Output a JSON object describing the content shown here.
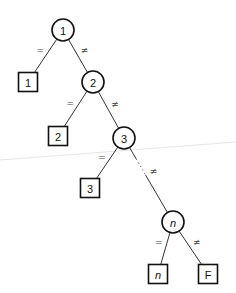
{
  "diagram": {
    "type": "decision-tree",
    "nodes": [
      {
        "id": "c1",
        "kind": "circle",
        "label": "1",
        "italic": false
      },
      {
        "id": "s1",
        "kind": "square",
        "label": "1",
        "italic": false
      },
      {
        "id": "c2",
        "kind": "circle",
        "label": "2",
        "italic": false
      },
      {
        "id": "s2",
        "kind": "square",
        "label": "2",
        "italic": false
      },
      {
        "id": "c3",
        "kind": "circle",
        "label": "3",
        "italic": false
      },
      {
        "id": "s3",
        "kind": "square",
        "label": "3",
        "italic": false
      },
      {
        "id": "cn",
        "kind": "circle",
        "label": "n",
        "italic": true
      },
      {
        "id": "sn",
        "kind": "square",
        "label": "n",
        "italic": true
      },
      {
        "id": "sF",
        "kind": "square",
        "label": "F",
        "italic": false
      }
    ],
    "edges": [
      {
        "from": "c1",
        "to": "s1",
        "label": "=",
        "style": "solid"
      },
      {
        "from": "c1",
        "to": "c2",
        "label": "≠",
        "style": "solid"
      },
      {
        "from": "c2",
        "to": "s2",
        "label": "=",
        "style": "solid"
      },
      {
        "from": "c2",
        "to": "c3",
        "label": "≠",
        "style": "solid"
      },
      {
        "from": "c3",
        "to": "s3",
        "label": "=",
        "style": "solid"
      },
      {
        "from": "c3",
        "to": "cn",
        "label": "≠",
        "style": "dotted-then-solid"
      },
      {
        "from": "cn",
        "to": "sn",
        "label": "=",
        "style": "solid"
      },
      {
        "from": "cn",
        "to": "sF",
        "label": "≠",
        "style": "solid"
      }
    ]
  }
}
